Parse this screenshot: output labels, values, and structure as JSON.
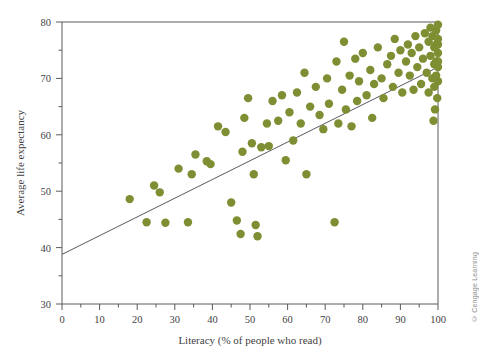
{
  "chart_data": {
    "type": "scatter",
    "title": "",
    "xlabel": "Literacy (% of people who read)",
    "ylabel": "Average life expectancy",
    "xlim": [
      0,
      100
    ],
    "ylim": [
      30,
      80
    ],
    "xticks": [
      0,
      10,
      20,
      30,
      40,
      50,
      60,
      70,
      80,
      90,
      100
    ],
    "yticks": [
      30,
      40,
      50,
      60,
      70,
      80
    ],
    "x_minor_step": 5,
    "y_minor_step": 5,
    "grid": false,
    "legend": null,
    "marker_color": "#7d8f32",
    "marker_size": 4.2,
    "line_color": "#56565e",
    "trend_line": {
      "type": "linear-fit",
      "x": [
        0,
        100
      ],
      "y": [
        38.8,
        72.0
      ]
    },
    "points": [
      [
        18.0,
        48.6
      ],
      [
        22.5,
        44.5
      ],
      [
        24.5,
        51.0
      ],
      [
        26.0,
        49.8
      ],
      [
        27.5,
        44.4
      ],
      [
        31.0,
        54.0
      ],
      [
        33.5,
        44.5
      ],
      [
        34.5,
        53.0
      ],
      [
        35.5,
        56.5
      ],
      [
        38.5,
        55.3
      ],
      [
        39.5,
        54.8
      ],
      [
        41.5,
        61.5
      ],
      [
        43.5,
        60.5
      ],
      [
        45.0,
        48.0
      ],
      [
        46.5,
        44.8
      ],
      [
        47.5,
        42.4
      ],
      [
        48.0,
        57.0
      ],
      [
        48.5,
        63.0
      ],
      [
        49.5,
        66.5
      ],
      [
        50.5,
        58.5
      ],
      [
        51.0,
        53.0
      ],
      [
        51.5,
        44.0
      ],
      [
        52.0,
        42.0
      ],
      [
        53.0,
        57.8
      ],
      [
        54.5,
        62.0
      ],
      [
        55.0,
        58.0
      ],
      [
        56.0,
        66.0
      ],
      [
        57.5,
        62.5
      ],
      [
        58.5,
        67.0
      ],
      [
        59.5,
        55.5
      ],
      [
        60.5,
        64.0
      ],
      [
        61.5,
        59.0
      ],
      [
        62.5,
        67.5
      ],
      [
        63.5,
        62.0
      ],
      [
        64.5,
        71.0
      ],
      [
        65.0,
        53.0
      ],
      [
        66.0,
        65.0
      ],
      [
        67.5,
        68.5
      ],
      [
        68.5,
        63.5
      ],
      [
        69.5,
        61.0
      ],
      [
        70.5,
        70.0
      ],
      [
        71.0,
        65.5
      ],
      [
        72.5,
        44.5
      ],
      [
        73.0,
        73.0
      ],
      [
        73.5,
        62.0
      ],
      [
        74.5,
        68.0
      ],
      [
        75.0,
        76.5
      ],
      [
        75.5,
        64.5
      ],
      [
        76.5,
        70.5
      ],
      [
        77.0,
        61.5
      ],
      [
        78.0,
        73.5
      ],
      [
        78.5,
        66.0
      ],
      [
        79.0,
        69.5
      ],
      [
        80.0,
        74.5
      ],
      [
        81.0,
        67.0
      ],
      [
        82.0,
        71.5
      ],
      [
        82.5,
        63.0
      ],
      [
        83.0,
        69.0
      ],
      [
        84.0,
        75.5
      ],
      [
        85.0,
        70.0
      ],
      [
        85.5,
        66.5
      ],
      [
        86.5,
        72.5
      ],
      [
        87.5,
        74.0
      ],
      [
        88.0,
        68.5
      ],
      [
        88.5,
        77.0
      ],
      [
        89.5,
        71.0
      ],
      [
        90.0,
        75.0
      ],
      [
        90.5,
        67.5
      ],
      [
        91.5,
        73.0
      ],
      [
        92.0,
        76.0
      ],
      [
        92.5,
        70.5
      ],
      [
        93.0,
        74.5
      ],
      [
        93.5,
        68.0
      ],
      [
        94.0,
        77.5
      ],
      [
        94.5,
        72.0
      ],
      [
        95.0,
        75.5
      ],
      [
        95.5,
        69.0
      ],
      [
        96.0,
        73.5
      ],
      [
        96.5,
        78.0
      ],
      [
        97.0,
        71.0
      ],
      [
        97.5,
        76.5
      ],
      [
        97.5,
        67.5
      ],
      [
        98.0,
        74.0
      ],
      [
        98.0,
        79.0
      ],
      [
        98.5,
        70.0
      ],
      [
        98.5,
        77.5
      ],
      [
        99.0,
        72.5
      ],
      [
        99.0,
        75.5
      ],
      [
        99.0,
        68.5
      ],
      [
        99.5,
        78.5
      ],
      [
        99.5,
        73.0
      ],
      [
        99.5,
        76.0
      ],
      [
        99.5,
        70.5
      ],
      [
        100.0,
        79.5
      ],
      [
        100.0,
        77.0
      ],
      [
        100.0,
        74.5
      ],
      [
        100.0,
        72.0
      ],
      [
        100.0,
        69.5
      ],
      [
        100.0,
        76.0
      ],
      [
        100.0,
        73.0
      ],
      [
        99.8,
        66.5
      ],
      [
        99.2,
        64.5
      ],
      [
        98.8,
        62.5
      ]
    ]
  },
  "credit": {
    "text": "© Cengage Learning"
  }
}
